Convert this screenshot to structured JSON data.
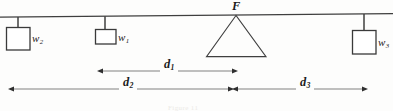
{
  "figure": {
    "background_color": "#fdfdfc",
    "ink_color": "#3a3a3a",
    "text_color": "#1b1b1b"
  },
  "beam": {
    "name": "horizontal beam",
    "x_start": 0,
    "x_end": 393,
    "y_start": 17,
    "y_end": 14
  },
  "fulcrum": {
    "label": "F",
    "apex_x": 236,
    "apex_y": 15,
    "base_left_x": 206,
    "base_right_x": 266,
    "base_y": 57
  },
  "weights": [
    {
      "label": "w",
      "subscript": "2",
      "box_x": 6,
      "box_y": 27,
      "box_w": 24,
      "box_h": 23,
      "hanger_x": 18,
      "hanger_top": 17,
      "label_x": 32,
      "label_y": 40
    },
    {
      "label": "w",
      "subscript": "1",
      "box_x": 95,
      "box_y": 29,
      "box_w": 21,
      "box_h": 15,
      "hanger_x": 105,
      "hanger_top": 16,
      "label_x": 118,
      "label_y": 39
    },
    {
      "label": "w",
      "subscript": "3",
      "box_x": 352,
      "box_y": 30,
      "box_w": 24,
      "box_h": 24,
      "hanger_x": 364,
      "hanger_top": 14,
      "label_x": 378,
      "label_y": 44
    }
  ],
  "dimensions": [
    {
      "label": "d",
      "subscript": "1",
      "from_x": 103,
      "to_x": 232,
      "y": 71,
      "label_x": 167,
      "label_y": 66,
      "arrow_left": true,
      "arrow_right": true
    },
    {
      "label": "d",
      "subscript": "2",
      "from_x": 14,
      "to_x": 228,
      "y": 89,
      "label_x": 126,
      "label_y": 84,
      "arrow_left": true,
      "arrow_right": true
    },
    {
      "label": "d",
      "subscript": "3",
      "from_x": 238,
      "to_x": 362,
      "y": 89,
      "label_x": 303,
      "label_y": 84,
      "arrow_left": true,
      "arrow_right": true
    }
  ],
  "caption": {
    "text": "Figure 11"
  }
}
